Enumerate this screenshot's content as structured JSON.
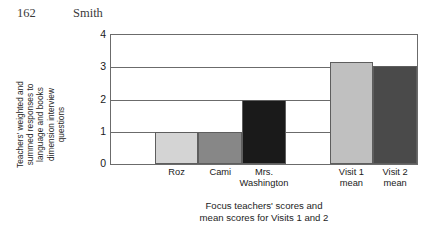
{
  "header": {
    "page_number": "162",
    "running_head": "Smith"
  },
  "chart_data": {
    "type": "bar",
    "title": "",
    "categories": [
      "Roz",
      "Cami",
      "Mrs.\nWashington",
      "Visit 1\nmean",
      "Visit 2\nmean"
    ],
    "values": [
      1,
      1,
      2,
      3.15,
      3.05
    ],
    "bar_colors": [
      "#d4d4d4",
      "#878787",
      "#1a1a1a",
      "#c0c0c0",
      "#4a4a4a"
    ],
    "xlabel": "Focus teachers' scores and\nmean scores for Visits 1 and 2",
    "ylabel": "Teachers' weighted and\nsummed responses to\nlanguage and books\ndimension interview\nquestions",
    "ylim": [
      0,
      4
    ],
    "yticks": [
      0,
      1,
      2,
      3,
      4
    ],
    "ytick_labels": [
      "0",
      "1",
      "2",
      "3",
      "4"
    ],
    "grid": true,
    "legend": "none",
    "axis_color": "#6b6b6b",
    "slot_count": 7,
    "bar_slots": [
      1,
      2,
      3,
      5,
      6
    ]
  }
}
